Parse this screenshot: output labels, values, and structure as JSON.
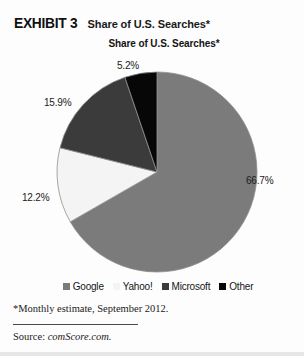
{
  "exhibit": {
    "label": "EXHIBIT 3",
    "title": "Share of U.S. Searches*"
  },
  "chart_data": {
    "type": "pie",
    "title": "Share of U.S. Searches*",
    "xlabel": "",
    "ylabel": "",
    "legend_position": "bottom",
    "grid": false,
    "start_angle_deg": 0,
    "direction": "clockwise",
    "categories": [
      "Google",
      "Yahoo!",
      "Microsoft",
      "Other"
    ],
    "values": [
      66.7,
      12.2,
      15.9,
      5.2
    ],
    "value_labels": [
      "66.7%",
      "12.2%",
      "15.9%",
      "5.2%"
    ],
    "colors": [
      "#7b7b7b",
      "#f4f4f4",
      "#3b3b3b",
      "#070707"
    ],
    "slice_border_color": "#8f8f8f",
    "units": "percent"
  },
  "legend": {
    "items": [
      {
        "label": "Google",
        "color": "#7b7b7b"
      },
      {
        "label": "Yahoo!",
        "color": "#f4f4f4"
      },
      {
        "label": "Microsoft",
        "color": "#3b3b3b"
      },
      {
        "label": "Other",
        "color": "#070707"
      }
    ]
  },
  "notes": {
    "footnote": "*Monthly estimate, September 2012.",
    "source_label": "Source:",
    "source_value": "comScore.com."
  }
}
